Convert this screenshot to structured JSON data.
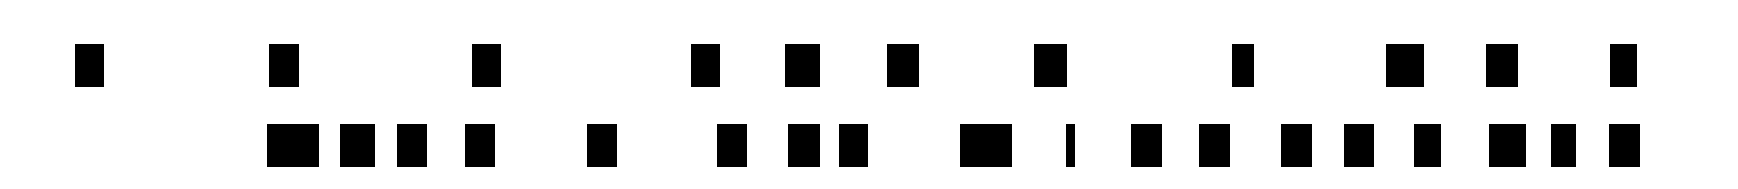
{
  "canvas": {
    "width": 1738,
    "height": 189,
    "background": "#ffffff",
    "block_color": "#000000"
  },
  "rows": [
    {
      "name": "top-row",
      "top": 44,
      "height": 43,
      "blocks": [
        {
          "x": 75,
          "w": 29
        },
        {
          "x": 269,
          "w": 30
        },
        {
          "x": 472,
          "w": 29
        },
        {
          "x": 691,
          "w": 29
        },
        {
          "x": 785,
          "w": 35
        },
        {
          "x": 887,
          "w": 32
        },
        {
          "x": 1034,
          "w": 33
        },
        {
          "x": 1232,
          "w": 22
        },
        {
          "x": 1386,
          "w": 38
        },
        {
          "x": 1486,
          "w": 32
        },
        {
          "x": 1610,
          "w": 27
        }
      ]
    },
    {
      "name": "bottom-row",
      "top": 124,
      "height": 43,
      "blocks": [
        {
          "x": 267,
          "w": 52
        },
        {
          "x": 340,
          "w": 35
        },
        {
          "x": 397,
          "w": 30
        },
        {
          "x": 465,
          "w": 30
        },
        {
          "x": 587,
          "w": 30
        },
        {
          "x": 717,
          "w": 30
        },
        {
          "x": 788,
          "w": 32
        },
        {
          "x": 839,
          "w": 29
        },
        {
          "x": 960,
          "w": 52
        },
        {
          "x": 1066,
          "w": 9
        },
        {
          "x": 1131,
          "w": 31
        },
        {
          "x": 1199,
          "w": 31
        },
        {
          "x": 1281,
          "w": 31
        },
        {
          "x": 1344,
          "w": 30
        },
        {
          "x": 1414,
          "w": 27
        },
        {
          "x": 1489,
          "w": 37
        },
        {
          "x": 1551,
          "w": 25
        },
        {
          "x": 1609,
          "w": 31
        }
      ]
    }
  ]
}
